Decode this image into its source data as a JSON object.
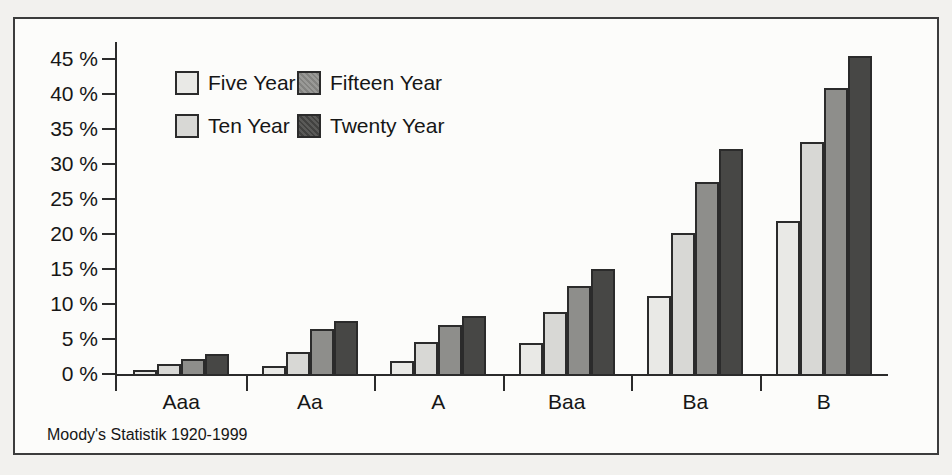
{
  "chart_data": {
    "type": "bar",
    "title": "",
    "categories": [
      "Aaa",
      "Aa",
      "A",
      "Baa",
      "Ba",
      "B"
    ],
    "series": [
      {
        "name": "Five Year",
        "color": "#e9e9e6",
        "textured": false,
        "values": [
          0.6,
          1.2,
          1.8,
          4.4,
          11.1,
          21.9
        ]
      },
      {
        "name": "Ten Year",
        "color": "#d8d8d5",
        "textured": false,
        "values": [
          1.4,
          3.2,
          4.5,
          8.8,
          20.2,
          33.2
        ]
      },
      {
        "name": "Fifteen Year",
        "color": "#8e8e8b",
        "textured": true,
        "values": [
          2.1,
          6.4,
          7.0,
          12.5,
          27.4,
          40.9
        ]
      },
      {
        "name": "Twenty Year",
        "color": "#474745",
        "textured": true,
        "values": [
          2.9,
          7.5,
          8.3,
          15.0,
          32.2,
          45.4
        ]
      }
    ],
    "y_axis": {
      "min": 0,
      "max": 45,
      "step": 5,
      "tick_labels": [
        "0 %",
        "5 %",
        "10 %",
        "15 %",
        "20 %",
        "25 %",
        "30 %",
        "35 %",
        "40 %",
        "45 %"
      ]
    },
    "x_axis": {
      "labels": [
        "Aaa",
        "Aa",
        "A",
        "Baa",
        "Ba",
        "B"
      ]
    },
    "grid": false,
    "legend_position": "top-left-inside",
    "legend_layout": [
      [
        "Five Year",
        "Fifteen Year"
      ],
      [
        "Ten Year",
        "Twenty Year"
      ]
    ],
    "ylabel": "",
    "xlabel": "",
    "source": "Moody's Statistik 1920-1999"
  },
  "footer": {
    "source_note": "Moody's Statistik 1920-1999"
  }
}
